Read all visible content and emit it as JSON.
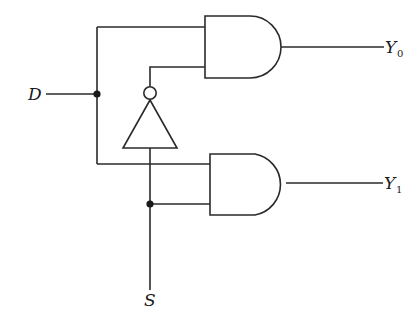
{
  "diagram": {
    "type": "logic-circuit",
    "inputs": [
      {
        "id": "D",
        "label": "D"
      },
      {
        "id": "S",
        "label": "S"
      }
    ],
    "outputs": [
      {
        "id": "Y0",
        "label": "Y",
        "subscript": "0"
      },
      {
        "id": "Y1",
        "label": "Y",
        "subscript": "1"
      }
    ],
    "gates": [
      {
        "id": "not1",
        "type": "NOT",
        "input": "S",
        "output": "S'"
      },
      {
        "id": "and0",
        "type": "AND",
        "inputs": [
          "D",
          "S'"
        ],
        "output": "Y0"
      },
      {
        "id": "and1",
        "type": "AND",
        "inputs": [
          "D",
          "S"
        ],
        "output": "Y1"
      }
    ],
    "junctions": [
      "D-branch",
      "S-branch"
    ]
  },
  "labels": {
    "d": "D",
    "s": "S",
    "y0_main": "Y",
    "y0_sub": "0",
    "y1_main": "Y",
    "y1_sub": "1"
  }
}
